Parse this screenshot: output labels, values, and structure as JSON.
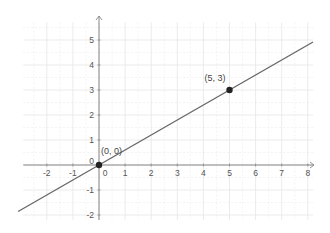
{
  "chart_data": {
    "type": "line",
    "title": "",
    "xlabel": "",
    "ylabel": "",
    "xlim": [
      -2.9,
      8.3
    ],
    "ylim": [
      -2.3,
      5.9
    ],
    "grid": true,
    "x_ticks": [
      -2,
      -1,
      0,
      1,
      2,
      3,
      4,
      5,
      6,
      7,
      8
    ],
    "y_ticks": [
      -2,
      -1,
      0,
      1,
      2,
      3,
      4,
      5
    ],
    "x_tick_labels": [
      "-2",
      "-1",
      "0",
      "1",
      "2",
      "3",
      "4",
      "5",
      "6",
      "7",
      "8"
    ],
    "y_tick_labels": [
      "-2",
      "-1",
      "0",
      "1",
      "2",
      "3",
      "4",
      "5"
    ],
    "series": [
      {
        "name": "line y = 0.6x",
        "slope": 0.6,
        "intercept": 0,
        "x": [
          -3.1,
          8.2
        ],
        "y": [
          -1.86,
          4.92
        ]
      }
    ],
    "points": [
      {
        "x": 0,
        "y": 0,
        "label": "(0, 0)"
      },
      {
        "x": 5,
        "y": 3,
        "label": "(5, 3)"
      }
    ],
    "colors": {
      "line": "#666666",
      "axis": "#888888",
      "grid": "#e6e6e6",
      "point": "#222222"
    }
  }
}
